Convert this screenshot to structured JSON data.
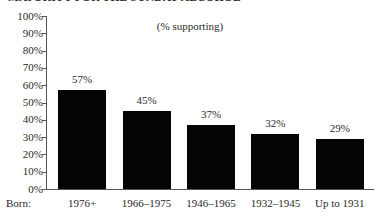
{
  "chart_data": {
    "type": "bar",
    "title": "MAJORITY FOR THE SUNDAY ALCOHOL",
    "subtitle": "",
    "annotation": "(% supporting)",
    "xlabel": "Born:",
    "ylabel": "",
    "categories": [
      "1976+",
      "1966–1975",
      "1946–1965",
      "1932–1945",
      "Up to 1931"
    ],
    "values": [
      57,
      45,
      37,
      32,
      29
    ],
    "value_labels": [
      "57%",
      "45%",
      "37%",
      "32%",
      "29%"
    ],
    "ylim": [
      0,
      100
    ],
    "ytick_values": [
      100,
      90,
      80,
      70,
      60,
      50,
      40,
      30,
      20,
      10,
      0
    ],
    "ytick_labels": [
      "100%",
      "90%",
      "80%",
      "70%",
      "60%",
      "50%",
      "40%",
      "30%",
      "20%",
      "10%",
      "0%"
    ],
    "grid": false,
    "legend": "none",
    "bar_color": "#050505",
    "axis_color": "#555555",
    "text_color": "#2a2a2a",
    "background_color": "#ffffff"
  }
}
